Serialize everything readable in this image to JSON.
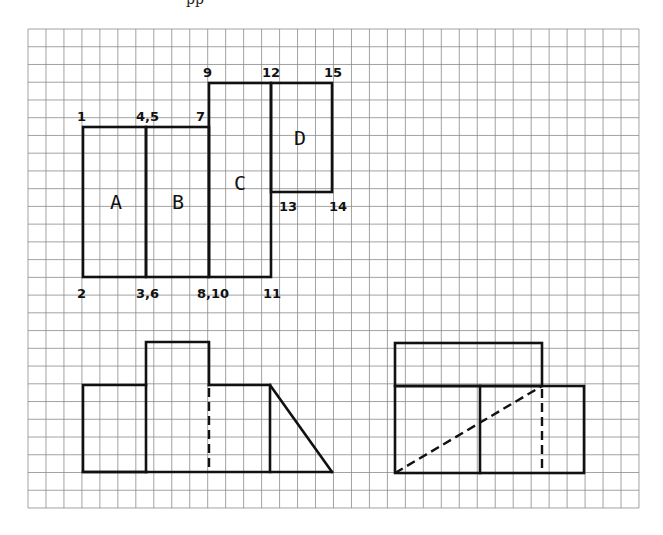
{
  "page": {
    "cropped_top_fragment": "pp"
  },
  "grid": {
    "x0": 28,
    "y0": 29,
    "cell": 17.97,
    "cols": 34,
    "rows": 27,
    "color": "#8a8a8a"
  },
  "top_view": {
    "faces": [
      {
        "label": "A",
        "x": 116,
        "y": 209
      },
      {
        "label": "B",
        "x": 178,
        "y": 209
      },
      {
        "label": "C",
        "x": 240,
        "y": 190
      },
      {
        "label": "D",
        "x": 300,
        "y": 145
      }
    ],
    "vertex_labels": [
      {
        "text": "1",
        "x": 77,
        "y": 121
      },
      {
        "text": "4,5",
        "x": 136,
        "y": 121
      },
      {
        "text": "7",
        "x": 196,
        "y": 121
      },
      {
        "text": "9",
        "x": 203,
        "y": 77
      },
      {
        "text": "12",
        "x": 262,
        "y": 77
      },
      {
        "text": "15",
        "x": 324,
        "y": 77
      },
      {
        "text": "13",
        "x": 279,
        "y": 211
      },
      {
        "text": "14",
        "x": 329,
        "y": 211
      },
      {
        "text": "2",
        "x": 77,
        "y": 298
      },
      {
        "text": "3,6",
        "x": 136,
        "y": 298
      },
      {
        "text": "8,10",
        "x": 197,
        "y": 298
      },
      {
        "text": "11",
        "x": 263,
        "y": 298
      }
    ]
  },
  "front_view": {
    "description": "Front elevation with stepped blocks and sloped face"
  },
  "side_view": {
    "description": "Side elevation with hidden diagonal edge"
  }
}
